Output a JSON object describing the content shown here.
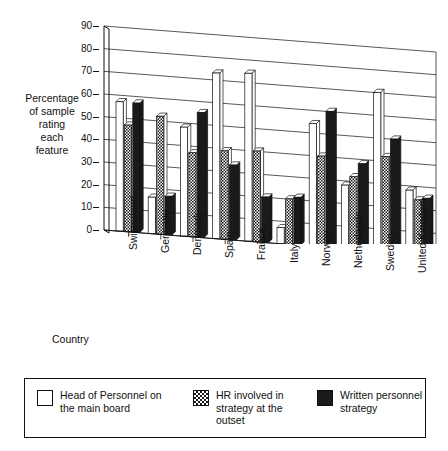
{
  "chart_data": {
    "type": "bar",
    "title": "",
    "xlabel": "Country",
    "ylabel": "Percentage of sample rating each feature",
    "ylabel_lines": [
      "Percentage",
      "of sample",
      "rating",
      "each",
      "feature"
    ],
    "ylim": [
      0,
      90
    ],
    "yticks": [
      0,
      10,
      20,
      30,
      40,
      50,
      60,
      70,
      80,
      90
    ],
    "ytick_labels": [
      "0",
      "10",
      "20",
      "30",
      "40",
      "50",
      "60",
      "70",
      "80",
      "90"
    ],
    "grid": true,
    "grid_orientation": "horizontal",
    "legend_position": "bottom",
    "perspective": "3d-receding",
    "categories": [
      "Switzerland",
      "Germany",
      "Denmark",
      "Spain",
      "France",
      "Italy",
      "Norway",
      "Netherlands",
      "Sweden",
      "United Kingdom"
    ],
    "series": [
      {
        "name": "Head of Personnel on the main board",
        "fill": "white",
        "color": "#ffffff",
        "values": [
          57,
          16,
          48,
          73,
          74,
          7,
          54,
          28,
          70,
          28
        ]
      },
      {
        "name": "HR involved in strategy at the outset",
        "fill": "hatched",
        "color": "#1a1a1a",
        "values": [
          47,
          52,
          37,
          39,
          40,
          20,
          40,
          32,
          42,
          24
        ]
      },
      {
        "name": "Written personnel strategy",
        "fill": "black",
        "color": "#1a1a1a",
        "values": [
          57,
          17,
          55,
          33,
          20,
          21,
          60,
          38,
          50,
          25
        ]
      }
    ]
  },
  "legend": {
    "items": [
      {
        "label_lines": [
          "Head of Personnel on",
          "the main board"
        ],
        "label": "Head of Personnel on the main board",
        "swatch": "white-swatch-icon"
      },
      {
        "label_lines": [
          "HR involved in",
          "strategy at the",
          "outset"
        ],
        "label": "HR involved in strategy at the outset",
        "swatch": "hatched-swatch-icon"
      },
      {
        "label_lines": [
          "Written personnel",
          "strategy"
        ],
        "label": "Written personnel strategy",
        "swatch": "black-swatch-icon"
      }
    ]
  }
}
